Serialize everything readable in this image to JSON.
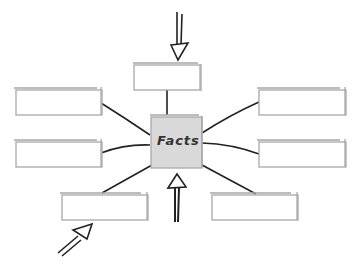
{
  "diagram": {
    "type": "graphic-organizer",
    "center": {
      "label": "Facts",
      "fill": "#d9d9d9",
      "x": 150,
      "y": 115,
      "w": 52,
      "h": 53
    },
    "boxes": [
      {
        "id": "top",
        "x": 134,
        "y": 63,
        "w": 66,
        "h": 27,
        "text": ""
      },
      {
        "id": "left-upper",
        "x": 15,
        "y": 88,
        "w": 87,
        "h": 27,
        "text": ""
      },
      {
        "id": "left-lower",
        "x": 15,
        "y": 140,
        "w": 87,
        "h": 27,
        "text": ""
      },
      {
        "id": "right-upper",
        "x": 258,
        "y": 88,
        "w": 88,
        "h": 27,
        "text": ""
      },
      {
        "id": "right-lower",
        "x": 258,
        "y": 140,
        "w": 88,
        "h": 27,
        "text": ""
      },
      {
        "id": "bottom-left",
        "x": 61,
        "y": 193,
        "w": 87,
        "h": 27,
        "text": ""
      },
      {
        "id": "bottom-right",
        "x": 211,
        "y": 193,
        "w": 87,
        "h": 27,
        "text": ""
      }
    ],
    "arrows": [
      {
        "id": "arrow-top",
        "direction": "down"
      },
      {
        "id": "arrow-center-bottom",
        "direction": "up"
      },
      {
        "id": "arrow-bottom-left",
        "direction": "up-right"
      }
    ],
    "colors": {
      "box_border": "#a8a8a8",
      "connector": "#222222",
      "center_fill": "#d9d9d9"
    }
  }
}
